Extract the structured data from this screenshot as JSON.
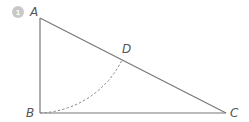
{
  "figure": {
    "number_badge": "1",
    "colors": {
      "line": "#777777",
      "badge": "#c8c8c8",
      "label": "#555555"
    },
    "points": {
      "A": {
        "label": "A",
        "x": 40,
        "y": 18
      },
      "B": {
        "label": "B",
        "x": 40,
        "y": 113
      },
      "C": {
        "label": "C",
        "x": 226,
        "y": 113
      },
      "D": {
        "label": "D",
        "x": 122,
        "y": 57
      }
    },
    "segments": [
      "AB",
      "BC",
      "CA"
    ],
    "arc": {
      "center": "A",
      "from": "B",
      "to": "D",
      "style": "dashed"
    }
  }
}
